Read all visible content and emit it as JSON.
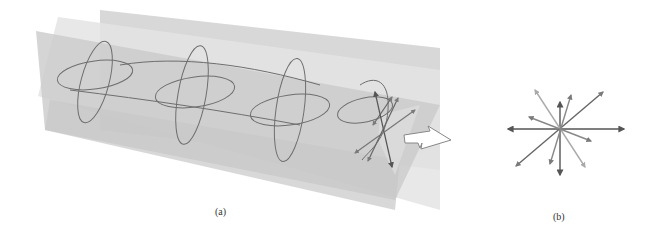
{
  "figure": {
    "panels": [
      {
        "id": "a",
        "label": "(a)",
        "description": "Unpolarized light wave: oscillations in many planes along the propagation axis, with propagation arrow"
      },
      {
        "id": "b",
        "label": "(b)",
        "description": "End-on view of electric field vectors in many directions"
      }
    ],
    "colors": {
      "plane_dark": "#c9c9c9",
      "plane_mid": "#d6d6d6",
      "plane_light": "#e3e3e3",
      "wave_line": "#6e6e6e",
      "arrow_dark": "#555555",
      "arrow_mid": "#7a7a7a",
      "arrow_light": "#aaaaaa",
      "outline_arrow": "#888888"
    }
  }
}
